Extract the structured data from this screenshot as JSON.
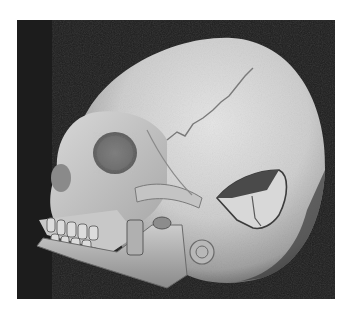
{
  "image": {
    "subject": "3D CT volume rendering of a human skull, left lateral oblique view",
    "description": "Grayscale skull render on dark background showing a depressed fracture fragment in the parietal region",
    "colors": {
      "page_background": "#ffffff",
      "frame_background": "#1c1c1c",
      "bone_light": "#e2e2e2",
      "bone_mid": "#b4b4b4",
      "bone_shadow": "#6a6a6a",
      "defect_dark": "#4a4a4a"
    },
    "features": [
      "cranium",
      "orbit",
      "nasal-cavity",
      "maxilla",
      "teeth",
      "mandible",
      "zygomatic-arch",
      "mastoid",
      "ear-canal",
      "fracture-defect",
      "coronal-suture"
    ]
  }
}
